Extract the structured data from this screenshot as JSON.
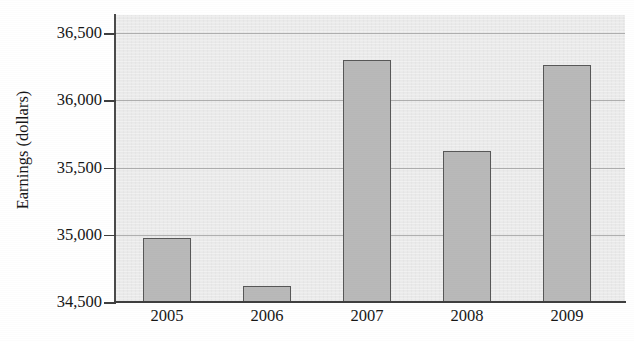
{
  "chart_data": {
    "type": "bar",
    "title": "",
    "xlabel": "",
    "ylabel": "Earnings (dollars)",
    "categories": [
      "2005",
      "2006",
      "2007",
      "2008",
      "2009"
    ],
    "values": [
      34975,
      34620,
      36300,
      35620,
      36265
    ],
    "ylim": [
      34500,
      36500
    ],
    "ytick_values": [
      34500,
      35000,
      35500,
      36000,
      36500
    ],
    "ytick_labels": [
      "34,500",
      "35,000",
      "35,500",
      "36,000",
      "36,500"
    ],
    "grid": true,
    "grid_axis": "y",
    "legend": false,
    "legend_position": "none",
    "bar_fill_color": "#b9b9b9",
    "bar_edge_color": "#585858",
    "plot_background_color": "#ebebeb",
    "figure_background_color": "#ffffff",
    "gridline_color": "#9a9a9a",
    "axis_color": "#3f3f3f",
    "series": [
      {
        "name": "Earnings",
        "values": [
          34975,
          34620,
          36300,
          35620,
          36265
        ]
      }
    ],
    "points": [
      {
        "category": "2005",
        "value": 34975
      },
      {
        "category": "2006",
        "value": 34620
      },
      {
        "category": "2007",
        "value": 36300
      },
      {
        "category": "2008",
        "value": 35620
      },
      {
        "category": "2009",
        "value": 36265
      }
    ]
  }
}
